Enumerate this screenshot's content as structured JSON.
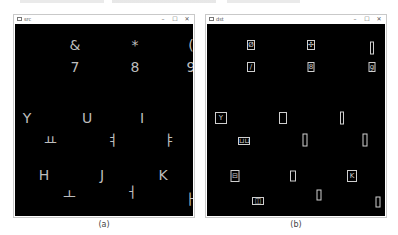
{
  "windows": [
    {
      "title": "src",
      "controls": {
        "minimize": "–",
        "maximize": "☐",
        "close": "✕"
      },
      "glyphs": [
        {
          "char": "&",
          "x": 60,
          "y": 21
        },
        {
          "char": "*",
          "x": 120,
          "y": 21
        },
        {
          "char": "(",
          "x": 176,
          "y": 21
        },
        {
          "char": "7",
          "x": 60,
          "y": 43
        },
        {
          "char": "8",
          "x": 120,
          "y": 43
        },
        {
          "char": "9",
          "x": 176,
          "y": 43
        },
        {
          "char": "Y",
          "x": 12,
          "y": 94
        },
        {
          "char": "U",
          "x": 72,
          "y": 94
        },
        {
          "char": "I",
          "x": 127,
          "y": 94
        },
        {
          "char": "ㅛ",
          "x": 35,
          "y": 116
        },
        {
          "char": "ㅕ",
          "x": 97,
          "y": 116
        },
        {
          "char": "ㅑ",
          "x": 154,
          "y": 116
        },
        {
          "char": "H",
          "x": 29,
          "y": 151
        },
        {
          "char": "J",
          "x": 87,
          "y": 151
        },
        {
          "char": "K",
          "x": 148,
          "y": 151
        },
        {
          "char": "ㅗ",
          "x": 54,
          "y": 170
        },
        {
          "char": "ㅓ",
          "x": 116,
          "y": 168
        },
        {
          "char": "ㅏ",
          "x": 175,
          "y": 175
        }
      ]
    },
    {
      "title": "dst",
      "controls": {
        "minimize": "–",
        "maximize": "☐",
        "close": "✕"
      },
      "boxes": [
        {
          "label": "Ø",
          "x": 44,
          "y": 21,
          "w": 8,
          "h": 10
        },
        {
          "label": "✣",
          "x": 104,
          "y": 21,
          "w": 8,
          "h": 10
        },
        {
          "label": "",
          "x": 165,
          "y": 24,
          "w": 4,
          "h": 13
        },
        {
          "label": "/",
          "x": 44,
          "y": 43,
          "w": 8,
          "h": 10
        },
        {
          "label": "8",
          "x": 104,
          "y": 43,
          "w": 7,
          "h": 10
        },
        {
          "label": "g",
          "x": 165,
          "y": 43,
          "w": 7,
          "h": 10
        },
        {
          "label": "Y",
          "x": 14,
          "y": 94,
          "w": 12,
          "h": 12
        },
        {
          "label": "",
          "x": 76,
          "y": 94,
          "w": 8,
          "h": 12
        },
        {
          "label": "",
          "x": 135,
          "y": 94,
          "w": 4,
          "h": 13
        },
        {
          "label": "⊔⊔",
          "x": 37,
          "y": 117,
          "w": 12,
          "h": 8
        },
        {
          "label": "",
          "x": 98,
          "y": 116,
          "w": 5,
          "h": 13
        },
        {
          "label": "",
          "x": 158,
          "y": 116,
          "w": 5,
          "h": 13
        },
        {
          "label": "⊟",
          "x": 28,
          "y": 152,
          "w": 9,
          "h": 12
        },
        {
          "label": "",
          "x": 86,
          "y": 152,
          "w": 6,
          "h": 11
        },
        {
          "label": "K",
          "x": 145,
          "y": 152,
          "w": 10,
          "h": 12
        },
        {
          "label": "◫",
          "x": 51,
          "y": 177,
          "w": 12,
          "h": 8
        },
        {
          "label": "",
          "x": 112,
          "y": 171,
          "w": 5,
          "h": 11
        },
        {
          "label": "",
          "x": 171,
          "y": 178,
          "w": 5,
          "h": 11
        }
      ]
    }
  ],
  "captions": {
    "left": "(a)",
    "right": "(b)"
  }
}
